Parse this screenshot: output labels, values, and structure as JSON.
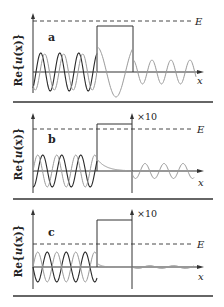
{
  "figure": {
    "ylabel_prefix": "Re{",
    "ylabel_var": "u",
    "ylabel_suffix": "(x)}",
    "xlabel": "x",
    "energy_label": "E",
    "colors": {
      "dark_wave": "#2a2a2a",
      "light_wave": "#9a9a9a",
      "axes": "#333333",
      "separator": "#333333"
    }
  },
  "panels": [
    {
      "letter": "a",
      "case": "energy above barrier (E > V)",
      "scale_label": "",
      "energy_above_barrier": true,
      "incident_amplitude": 1.0,
      "barrier_wave": "oscillating, longer wavelength",
      "transmitted_amplitude": 0.55
    },
    {
      "letter": "b",
      "case": "energy below barrier, thin barrier (tunneling)",
      "scale_label": "×10",
      "energy_above_barrier": false,
      "incident_amplitude": 1.0,
      "barrier_wave": "decaying exponential",
      "transmitted_amplitude": 0.45
    },
    {
      "letter": "c",
      "case": "energy below barrier, weak transmission",
      "scale_label": "×10",
      "energy_above_barrier": false,
      "incident_amplitude": 1.0,
      "barrier_wave": "rapidly decaying",
      "transmitted_amplitude": 0.05
    }
  ]
}
